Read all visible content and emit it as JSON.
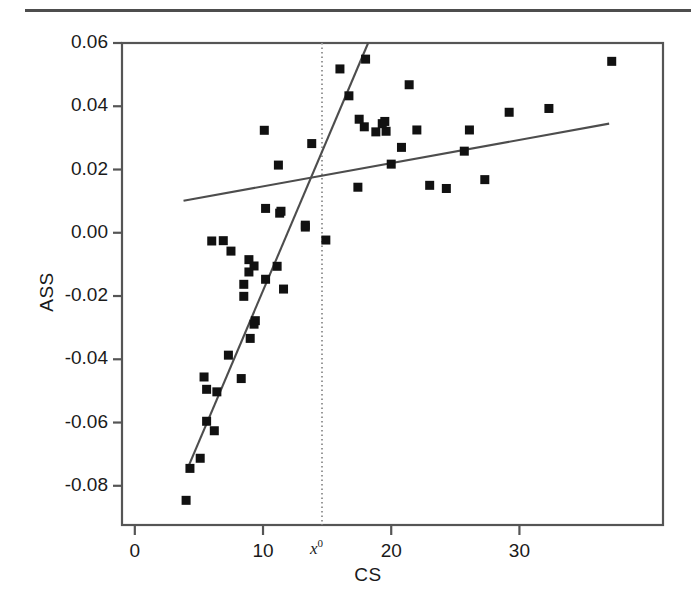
{
  "figure": {
    "top_rule": true,
    "background": "#ffffff",
    "ink_color": "#1a1a1a",
    "frame_color": "#555555",
    "point_color": "#111111"
  },
  "chart_data": {
    "type": "scatter",
    "title": "",
    "xlabel": "CS",
    "ylabel": "ASS",
    "xlim": [
      -1.0,
      41.2
    ],
    "ylim": [
      -0.0924,
      0.06
    ],
    "grid": false,
    "legend": null,
    "xticks": [
      0,
      10,
      20,
      30
    ],
    "xtick_labels": [
      "0",
      "10",
      "20",
      "30"
    ],
    "yticks": [
      0.06,
      0.04,
      0.02,
      0.0,
      -0.02,
      -0.04,
      -0.06,
      -0.08
    ],
    "ytick_labels": [
      "0.06",
      "0.04",
      "0.02",
      "0.00",
      "-0.02",
      "-0.04",
      "-0.06",
      "-0.08"
    ],
    "annotations": [
      {
        "name": "threshold-label",
        "text": "x",
        "superscript": "0",
        "x": 14.6,
        "y": -0.0955,
        "description": "threshold value label below x-axis at the dotted vertical line"
      }
    ],
    "reference_lines": [
      {
        "name": "threshold-line",
        "orientation": "vertical",
        "x": 14.6,
        "style": "dotted",
        "color": "#999999",
        "description": "vertical dotted line marking the threshold x0"
      }
    ],
    "fit_lines": [
      {
        "name": "lower-regime-fit",
        "style": "solid",
        "color": "#4d4d4d",
        "x_start": 4.2,
        "y_start": -0.0737,
        "x_end": 18.2,
        "y_end": 0.06,
        "description": "steep regression line fitted to observations below the threshold"
      },
      {
        "name": "upper-regime-fit",
        "style": "solid",
        "color": "#4d4d4d",
        "x_start": 3.8,
        "y_start": 0.0101,
        "x_end": 37.0,
        "y_end": 0.0345,
        "description": "shallow regression line fitted to observations above the threshold"
      }
    ],
    "series": [
      {
        "name": "observations",
        "marker": "square",
        "marker_size": 9,
        "color": "#111111",
        "points": [
          [
            4.0,
            -0.0846
          ],
          [
            4.3,
            -0.0745
          ],
          [
            5.1,
            -0.0713
          ],
          [
            5.6,
            -0.0596
          ],
          [
            6.2,
            -0.0626
          ],
          [
            5.4,
            -0.0456
          ],
          [
            5.6,
            -0.0495
          ],
          [
            6.4,
            -0.0503
          ],
          [
            8.3,
            -0.0461
          ],
          [
            7.3,
            -0.0387
          ],
          [
            9.0,
            -0.0334
          ],
          [
            9.4,
            -0.0278
          ],
          [
            9.3,
            -0.0289
          ],
          [
            8.5,
            -0.0201
          ],
          [
            11.6,
            -0.0178
          ],
          [
            8.5,
            -0.0163
          ],
          [
            10.2,
            -0.0147
          ],
          [
            8.9,
            -0.0124
          ],
          [
            11.1,
            -0.0106
          ],
          [
            9.3,
            -0.0105
          ],
          [
            8.9,
            -0.0085
          ],
          [
            6.9,
            -0.0025
          ],
          [
            6.0,
            -0.0026
          ],
          [
            7.5,
            -0.0058
          ],
          [
            13.3,
            0.0018
          ],
          [
            13.3,
            0.0024
          ],
          [
            14.9,
            -0.0023
          ],
          [
            10.2,
            0.0077
          ],
          [
            11.3,
            0.0062
          ],
          [
            11.4,
            0.0068
          ],
          [
            17.4,
            0.0144
          ],
          [
            23.0,
            0.015
          ],
          [
            24.3,
            0.014
          ],
          [
            27.3,
            0.0168
          ],
          [
            11.2,
            0.0214
          ],
          [
            20.0,
            0.0217
          ],
          [
            25.7,
            0.0258
          ],
          [
            20.8,
            0.027
          ],
          [
            13.8,
            0.0282
          ],
          [
            10.1,
            0.0324
          ],
          [
            18.8,
            0.0319
          ],
          [
            19.6,
            0.0321
          ],
          [
            22.0,
            0.0325
          ],
          [
            26.1,
            0.0325
          ],
          [
            17.9,
            0.0335
          ],
          [
            19.3,
            0.0345
          ],
          [
            19.5,
            0.0352
          ],
          [
            17.5,
            0.0359
          ],
          [
            29.2,
            0.0381
          ],
          [
            32.3,
            0.0393
          ],
          [
            16.7,
            0.0433
          ],
          [
            21.4,
            0.0468
          ],
          [
            16.0,
            0.0518
          ],
          [
            18.0,
            0.0549
          ],
          [
            37.2,
            0.0542
          ]
        ]
      }
    ]
  }
}
